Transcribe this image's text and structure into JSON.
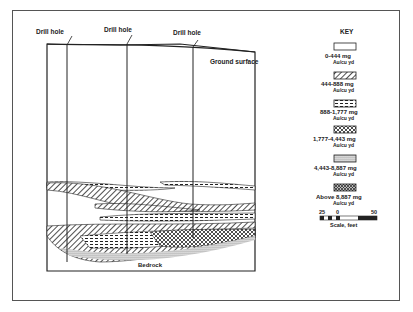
{
  "diagram": {
    "drill_hole_labels": [
      "Drill hole",
      "Drill hole",
      "Drill hole"
    ],
    "ground_surface_label": "Ground surface",
    "bedrock_label": "Bedrock"
  },
  "key": {
    "title": "KEY",
    "items": [
      {
        "range": "0-444 mg",
        "unit": "Au/cu yd",
        "pattern": "blank"
      },
      {
        "range": "444-888 mg",
        "unit": "Au/cu yd",
        "pattern": "diagonal"
      },
      {
        "range": "888-1,777 mg",
        "unit": "Au/cu yd",
        "pattern": "dashes"
      },
      {
        "range": "1,777-4,443 mg",
        "unit": "Au/cu yd",
        "pattern": "crosses"
      },
      {
        "range": "4,443-8,887 mg",
        "unit": "Au/cu yd",
        "pattern": "dense-dots"
      },
      {
        "range": "Above 8,887 mg",
        "unit": "Au/cu yd",
        "pattern": "crosshatch"
      }
    ],
    "scale": {
      "left": "25",
      "mid": "0",
      "right": "50",
      "label": "Scale, feet"
    }
  },
  "colors": {
    "ink": "#222222",
    "paper": "#ffffff"
  }
}
